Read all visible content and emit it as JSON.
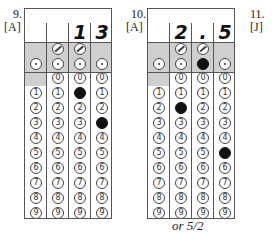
{
  "questions": [
    {
      "number": "9.",
      "answer_code": "[A]",
      "answer_chars": [
        "",
        "",
        "1",
        "3"
      ],
      "slash_columns": [
        1,
        2
      ],
      "dot_columns": [
        0,
        1,
        2,
        3
      ],
      "filled_digits": [
        {
          "column": 2,
          "digit": 1
        },
        {
          "column": 3,
          "digit": 3
        }
      ],
      "filled_dot_column": null,
      "note": ""
    },
    {
      "number": "10.",
      "answer_code": "[A]",
      "answer_chars": [
        "",
        "2",
        ".",
        "5"
      ],
      "slash_columns": [
        1,
        2
      ],
      "dot_columns": [
        0,
        1,
        2,
        3
      ],
      "filled_digits": [
        {
          "column": 1,
          "digit": 2
        },
        {
          "column": 3,
          "digit": 5
        }
      ],
      "filled_dot_column": 2,
      "note": "or 5/2"
    },
    {
      "number": "11.",
      "answer_code": "[J]"
    }
  ],
  "digits": [
    "0",
    "1",
    "2",
    "3",
    "4",
    "5",
    "6",
    "7",
    "8",
    "9"
  ]
}
